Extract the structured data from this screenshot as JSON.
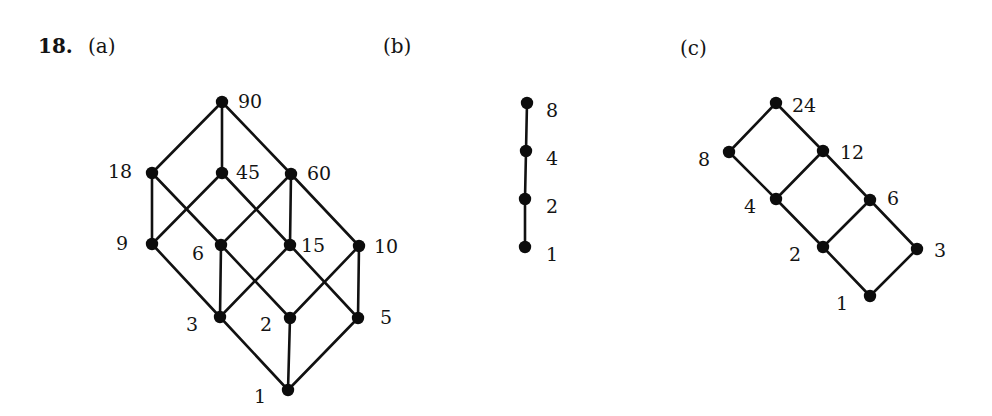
{
  "problem": {
    "number_label": "18.",
    "colors": {
      "ink": "#111111",
      "background": "#ffffff"
    }
  },
  "diagrams": [
    {
      "id": "a",
      "label": "(a)",
      "label_pos": [
        88,
        53
      ],
      "nodes": [
        {
          "id": "90",
          "text": "90",
          "x": 222,
          "y": 102,
          "lx": 238,
          "ly": 101
        },
        {
          "id": "18",
          "text": "18",
          "x": 152,
          "y": 173,
          "lx": 108,
          "ly": 171
        },
        {
          "id": "45",
          "text": "45",
          "x": 222,
          "y": 173,
          "lx": 236,
          "ly": 172
        },
        {
          "id": "60",
          "text": "60",
          "x": 291,
          "y": 174,
          "lx": 307,
          "ly": 173
        },
        {
          "id": "9",
          "text": "9",
          "x": 152,
          "y": 244,
          "lx": 116,
          "ly": 243
        },
        {
          "id": "6",
          "text": "6",
          "x": 221,
          "y": 245,
          "lx": 192,
          "ly": 253
        },
        {
          "id": "15",
          "text": "15",
          "x": 290,
          "y": 245,
          "lx": 301,
          "ly": 245
        },
        {
          "id": "10",
          "text": "10",
          "x": 359,
          "y": 246,
          "lx": 374,
          "ly": 246
        },
        {
          "id": "3",
          "text": "3",
          "x": 220,
          "y": 317,
          "lx": 186,
          "ly": 324
        },
        {
          "id": "2",
          "text": "2",
          "x": 290,
          "y": 318,
          "lx": 260,
          "ly": 324
        },
        {
          "id": "5",
          "text": "5",
          "x": 358,
          "y": 318,
          "lx": 380,
          "ly": 317
        },
        {
          "id": "1",
          "text": "1",
          "x": 288,
          "y": 390,
          "lx": 254,
          "ly": 396
        }
      ],
      "edges": [
        [
          "90",
          "18"
        ],
        [
          "90",
          "45"
        ],
        [
          "90",
          "60"
        ],
        [
          "18",
          "9"
        ],
        [
          "18",
          "6"
        ],
        [
          "45",
          "9"
        ],
        [
          "45",
          "15"
        ],
        [
          "60",
          "6"
        ],
        [
          "60",
          "15"
        ],
        [
          "60",
          "10"
        ],
        [
          "9",
          "3"
        ],
        [
          "6",
          "3"
        ],
        [
          "6",
          "2"
        ],
        [
          "15",
          "3"
        ],
        [
          "15",
          "5"
        ],
        [
          "10",
          "2"
        ],
        [
          "10",
          "5"
        ],
        [
          "3",
          "1"
        ],
        [
          "2",
          "1"
        ],
        [
          "5",
          "1"
        ]
      ]
    },
    {
      "id": "b",
      "label": "(b)",
      "label_pos": [
        383,
        53
      ],
      "nodes": [
        {
          "id": "8",
          "text": "8",
          "x": 527,
          "y": 103,
          "lx": 546,
          "ly": 110
        },
        {
          "id": "4",
          "text": "4",
          "x": 526,
          "y": 151,
          "lx": 546,
          "ly": 158
        },
        {
          "id": "2",
          "text": "2",
          "x": 525,
          "y": 199,
          "lx": 546,
          "ly": 206
        },
        {
          "id": "1",
          "text": "1",
          "x": 525,
          "y": 247,
          "lx": 546,
          "ly": 254
        }
      ],
      "edges": [
        [
          "8",
          "4"
        ],
        [
          "4",
          "2"
        ],
        [
          "2",
          "1"
        ]
      ]
    },
    {
      "id": "c",
      "label": "(c)",
      "label_pos": [
        680,
        55
      ],
      "nodes": [
        {
          "id": "24",
          "text": "24",
          "x": 776,
          "y": 103,
          "lx": 792,
          "ly": 105
        },
        {
          "id": "8",
          "text": "8",
          "x": 729,
          "y": 152,
          "lx": 698,
          "ly": 159
        },
        {
          "id": "12",
          "text": "12",
          "x": 823,
          "y": 151,
          "lx": 840,
          "ly": 152
        },
        {
          "id": "4",
          "text": "4",
          "x": 776,
          "y": 199,
          "lx": 744,
          "ly": 206
        },
        {
          "id": "6",
          "text": "6",
          "x": 870,
          "y": 200,
          "lx": 887,
          "ly": 198
        },
        {
          "id": "2",
          "text": "2",
          "x": 823,
          "y": 247,
          "lx": 789,
          "ly": 254
        },
        {
          "id": "3",
          "text": "3",
          "x": 917,
          "y": 249,
          "lx": 934,
          "ly": 250
        },
        {
          "id": "1",
          "text": "1",
          "x": 870,
          "y": 296,
          "lx": 836,
          "ly": 303
        }
      ],
      "edges": [
        [
          "24",
          "8"
        ],
        [
          "24",
          "12"
        ],
        [
          "8",
          "4"
        ],
        [
          "12",
          "4"
        ],
        [
          "12",
          "6"
        ],
        [
          "4",
          "2"
        ],
        [
          "6",
          "2"
        ],
        [
          "6",
          "3"
        ],
        [
          "2",
          "1"
        ],
        [
          "3",
          "1"
        ]
      ]
    }
  ]
}
